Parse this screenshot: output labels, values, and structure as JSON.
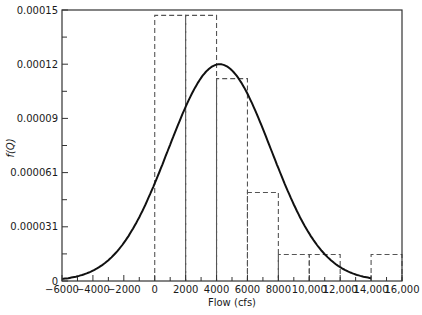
{
  "chart_data": {
    "type": "bar",
    "title": "",
    "xlabel": "Flow (cfs)",
    "ylabel": "f(Q)",
    "xlim": [
      -6000,
      16000
    ],
    "ylim": [
      0,
      0.00015
    ],
    "grid": false,
    "legend": null,
    "x_ticks": [
      -6000,
      -4000,
      -2000,
      0,
      2000,
      4000,
      6000,
      8000,
      10000,
      12000,
      14000,
      16000
    ],
    "x_tick_labels": [
      "−6000",
      "−4000",
      "−2000",
      "0",
      "2000",
      "4000",
      "6000",
      "8000",
      "10,000",
      "12,000",
      "14,000",
      "16,000"
    ],
    "x_minor_step": 1000,
    "y_ticks": [
      0,
      3.1e-05,
      6.1e-05,
      9e-05,
      0.00012,
      0.00015
    ],
    "y_tick_labels": [
      "0",
      "0.000031",
      "0.000061",
      "0.00009",
      "0.00012",
      "0.00015"
    ],
    "y_minor_between": true,
    "series": [
      {
        "name": "Histogram (relative frequency density)",
        "type": "bar",
        "style": "dashed",
        "bins": [
          {
            "from": 0,
            "to": 2000,
            "value": 0.000147
          },
          {
            "from": 2000,
            "to": 4000,
            "value": 0.000147
          },
          {
            "from": 4000,
            "to": 6000,
            "value": 0.000112
          },
          {
            "from": 6000,
            "to": 8000,
            "value": 4.9e-05
          },
          {
            "from": 8000,
            "to": 10000,
            "value": 1.47e-05
          },
          {
            "from": 10000,
            "to": 12000,
            "value": 1.47e-05
          },
          {
            "from": 12000,
            "to": 14000,
            "value": 0
          },
          {
            "from": 14000,
            "to": 16000,
            "value": 1.47e-05
          }
        ]
      },
      {
        "name": "Fitted normal PDF",
        "type": "line",
        "style": "solid",
        "mean": 4200,
        "std": 3325,
        "x_range": [
          -6000,
          14000
        ],
        "peak": {
          "x": 4200,
          "y": 0.00012
        }
      }
    ]
  }
}
